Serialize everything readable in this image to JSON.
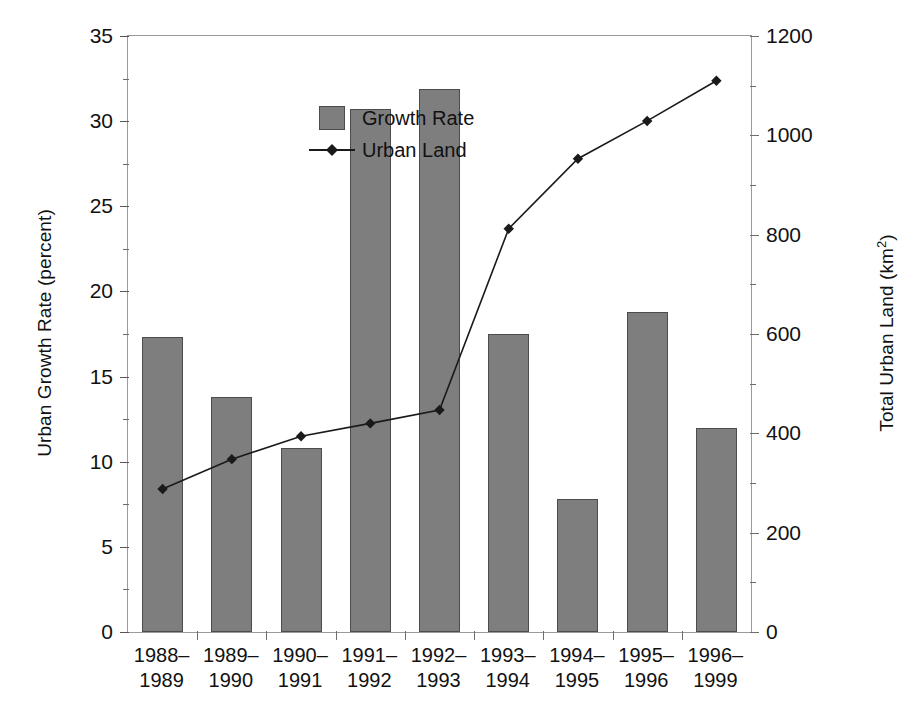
{
  "chart_data": {
    "type": "bar",
    "title": "",
    "subtitle": "",
    "categories": [
      "1988–1989",
      "1989–1990",
      "1990–1991",
      "1991–1992",
      "1992–1993",
      "1993–1994",
      "1994–1995",
      "1995–1996",
      "1996–1999"
    ],
    "categories_lines": [
      [
        "1988–",
        "1989"
      ],
      [
        "1989–",
        "1990"
      ],
      [
        "1990–",
        "1991"
      ],
      [
        "1991–",
        "1992"
      ],
      [
        "1992–",
        "1993"
      ],
      [
        "1993–",
        "1994"
      ],
      [
        "1994–",
        "1995"
      ],
      [
        "1995–",
        "1996"
      ],
      [
        "1996–",
        "1999"
      ]
    ],
    "xlabel": "",
    "ylabel": "Urban Growth Rate (percent)",
    "y2label": "Total Urban Land (km²)",
    "ylim": [
      0,
      35
    ],
    "y2lim": [
      0,
      1200
    ],
    "yticks": [
      0,
      5,
      10,
      15,
      20,
      25,
      30,
      35
    ],
    "y2ticks": [
      0,
      200,
      400,
      600,
      800,
      1000,
      1200
    ],
    "grid": false,
    "legend_position": "top-left",
    "series": [
      {
        "name": "Growth Rate",
        "kind": "bar",
        "axis": "left",
        "unit": "percent",
        "color": "#7e7e7e",
        "edge_color": "#4c4c4c",
        "values": [
          17.3,
          13.8,
          10.8,
          30.7,
          31.9,
          17.5,
          7.8,
          18.8,
          12.0
        ]
      },
      {
        "name": "Urban Land",
        "kind": "line",
        "axis": "right",
        "unit": "km²",
        "color": "#1a1a1a",
        "marker": "diamond",
        "values": [
          288,
          348,
          394,
          420,
          447,
          812,
          953,
          1029,
          1110
        ]
      }
    ]
  },
  "legend": {
    "items": [
      {
        "label": "Growth Rate",
        "key": "swatch"
      },
      {
        "label": "Urban Land",
        "key": "line-marker"
      }
    ]
  },
  "axes": {
    "left_title": "Urban Growth Rate (percent)",
    "right_title_main": "Total Urban Land (km",
    "right_title_sup": "2",
    "right_title_tail": ")"
  }
}
